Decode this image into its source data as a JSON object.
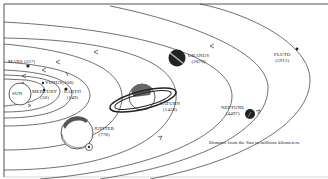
{
  "diagram": {
    "caption": "Distance from the Sun in millions kilometers.",
    "sun": {
      "label": "SUN"
    },
    "planets": [
      {
        "name": "MERCURY",
        "distance": "(58)"
      },
      {
        "name": "VENUS",
        "distance": "(108)"
      },
      {
        "name": "EARTH",
        "distance": "(149)"
      },
      {
        "name": "MARS",
        "distance": "(227)"
      },
      {
        "name": "JUPITER",
        "distance": "(778)"
      },
      {
        "name": "SATURN",
        "distance": "(1428)"
      },
      {
        "name": "URANUS",
        "distance": "(2870)"
      },
      {
        "name": "NEPTUNE",
        "distance": "(4497)"
      },
      {
        "name": "PLUTO",
        "distance": "(5913)"
      }
    ],
    "colors": {
      "line": "#333333",
      "background": "#ffffff",
      "planet_dark": "#222222"
    }
  }
}
